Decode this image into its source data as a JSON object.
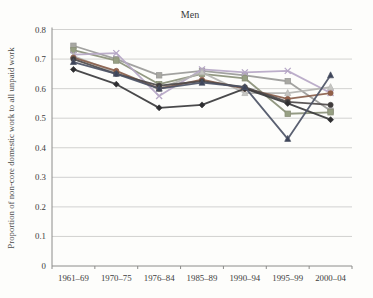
{
  "chart_data": {
    "type": "line",
    "title": "Men",
    "ylabel": "Proportion of non-core domestic work to all unpaid work",
    "xlabel": "",
    "categories": [
      "1961–69",
      "1970–75",
      "1976–84",
      "1985–89",
      "1990–94",
      "1995–99",
      "2000–04"
    ],
    "yticks": [
      0,
      0.1,
      0.2,
      0.3,
      0.4,
      0.5,
      0.6,
      0.7,
      0.8
    ],
    "ylim": [
      0,
      0.8
    ],
    "grid": "horizontal",
    "legend_position": "none",
    "series": [
      {
        "name": "series-gray-square",
        "marker": "square",
        "color": "#9a9a98",
        "fill": "#a8a8a2",
        "values": [
          0.745,
          0.7,
          0.645,
          0.66,
          0.645,
          0.625,
          0.525
        ]
      },
      {
        "name": "series-olive-square",
        "marker": "square",
        "color": "#8a9078",
        "fill": "#97a083",
        "values": [
          0.73,
          0.695,
          0.615,
          0.65,
          0.635,
          0.515,
          0.52
        ]
      },
      {
        "name": "series-lavender-x",
        "marker": "x",
        "color": "#b6a7c6",
        "fill": "#b6a7c6",
        "values": [
          0.715,
          0.72,
          0.575,
          0.665,
          0.655,
          0.66,
          0.585
        ]
      },
      {
        "name": "series-light-triangle",
        "marker": "triangle",
        "color": "#b3b3b0",
        "fill": "#c6c6c2",
        "values": [
          0.71,
          0.655,
          0.6,
          0.655,
          0.585,
          0.585,
          0.605
        ]
      },
      {
        "name": "series-brown-circle",
        "marker": "circle",
        "color": "#8a5f4c",
        "fill": "#935f48",
        "values": [
          0.705,
          0.66,
          0.6,
          0.63,
          0.6,
          0.565,
          0.585
        ]
      },
      {
        "name": "series-dark-circle",
        "marker": "circle",
        "color": "#4e4a4a",
        "fill": "#3f3b3b",
        "values": [
          0.7,
          0.65,
          0.61,
          0.625,
          0.605,
          0.555,
          0.545
        ]
      },
      {
        "name": "series-black-diamond",
        "marker": "diamond",
        "color": "#3a3a3c",
        "fill": "#2e2e30",
        "values": [
          0.665,
          0.615,
          0.535,
          0.545,
          0.6,
          0.55,
          0.495
        ]
      },
      {
        "name": "series-slate-triangle",
        "marker": "triangle",
        "color": "#4d5466",
        "fill": "#3e455a",
        "values": [
          0.69,
          0.65,
          0.6,
          0.62,
          0.605,
          0.43,
          0.645
        ]
      }
    ],
    "plot_colors": {
      "gridline": "#c7c7c5",
      "axis": "#8c8c8a",
      "background": "#fdfdfb"
    }
  }
}
